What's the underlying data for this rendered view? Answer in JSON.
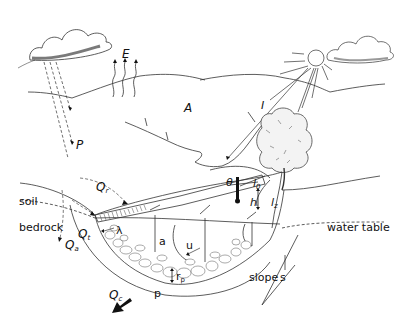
{
  "diagram": {
    "colors": {
      "line": "#333333",
      "fill_dark": "#111111",
      "background": "#ffffff"
    },
    "labels": {
      "evaporation": "E",
      "area": "A",
      "radiation": "I",
      "precipitation": "P",
      "runoff": {
        "main": "Q",
        "sub": "r"
      },
      "throughflow": {
        "main": "Q",
        "sub": "t"
      },
      "aquifer_flow": {
        "main": "Q",
        "sub": "a"
      },
      "channel_flow": {
        "main": "Q",
        "sub": "c"
      },
      "soil": "soil",
      "bedrock": "bedrock",
      "water_table": "water table",
      "theta": "θ",
      "l0": {
        "main": "l",
        "sub": "0"
      },
      "h": "h",
      "lz": {
        "main": "l",
        "sub": "z"
      },
      "a": "a",
      "u": "u",
      "lambda": "λ",
      "rp": {
        "main": "r",
        "sub": "p"
      },
      "p": "p",
      "slope": "slope",
      "s": "s"
    },
    "icons": [
      "cloud-rain",
      "cloud",
      "sun",
      "tree",
      "thermometer",
      "arrows-evaporation",
      "arrow-channel-flow"
    ]
  }
}
